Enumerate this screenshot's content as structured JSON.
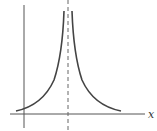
{
  "diagram": {
    "type": "function-graph",
    "x_axis_label": "x",
    "colors": {
      "curve": "#444444",
      "axis": "#555555",
      "asymptote": "#666666",
      "background": "#ffffff"
    },
    "elements": {
      "y_axis": {
        "x": 24,
        "y1": 5,
        "y2": 128
      },
      "x_axis": {
        "y": 114,
        "x1": 10,
        "x2": 145
      },
      "asymptote": {
        "x": 68,
        "style": "dashed"
      },
      "left_branch": "rises from near x-axis toward asymptote",
      "right_branch": "falls from asymptote toward x-axis"
    }
  }
}
